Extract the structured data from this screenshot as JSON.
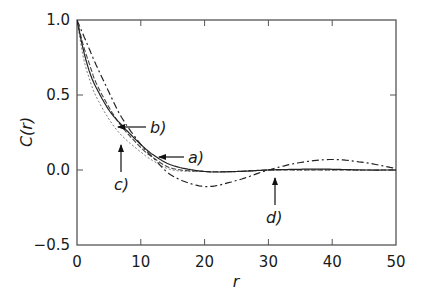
{
  "chart_data": {
    "type": "line",
    "title": "",
    "xlabel": "r",
    "ylabel": "C(r)",
    "xlim": [
      0,
      50
    ],
    "ylim": [
      -0.5,
      1.0
    ],
    "xticks": [
      0,
      10,
      20,
      30,
      40,
      50
    ],
    "yticks": [
      -0.5,
      0.0,
      0.5,
      1.0
    ],
    "xtick_labels": [
      "0",
      "10",
      "20",
      "30",
      "40",
      "50"
    ],
    "ytick_labels": [
      "−0.5",
      "0.0",
      "0.5",
      "1.0"
    ],
    "grid": false,
    "legend": "none (curves labeled with arrow annotations a)–d))",
    "x": [
      0,
      1,
      2,
      3,
      5,
      7,
      10,
      12,
      15,
      20,
      25,
      30,
      35,
      40,
      45,
      50
    ],
    "series": [
      {
        "name": "a)",
        "style": "solid",
        "values": [
          1.0,
          0.8,
          0.65,
          0.55,
          0.4,
          0.3,
          0.17,
          0.1,
          0.03,
          -0.01,
          -0.01,
          0.0,
          0.005,
          0.005,
          0.0,
          0.0
        ]
      },
      {
        "name": "b)",
        "style": "dashed",
        "values": [
          1.0,
          0.83,
          0.7,
          0.58,
          0.42,
          0.29,
          0.15,
          0.08,
          0.01,
          -0.01,
          -0.01,
          0.0,
          0.0,
          0.0,
          0.0,
          0.0
        ]
      },
      {
        "name": "c)",
        "style": "dotted",
        "values": [
          1.0,
          0.75,
          0.6,
          0.49,
          0.34,
          0.23,
          0.12,
          0.06,
          0.0,
          -0.01,
          -0.01,
          0.0,
          0.0,
          0.0,
          0.0,
          0.0
        ]
      },
      {
        "name": "d)",
        "style": "dash-dot",
        "values": [
          1.0,
          0.9,
          0.8,
          0.7,
          0.52,
          0.35,
          0.17,
          0.08,
          -0.04,
          -0.11,
          -0.07,
          0.0,
          0.05,
          0.07,
          0.05,
          0.01
        ]
      }
    ],
    "annotations": [
      {
        "label": "a)",
        "arrow": "horizontal, pointing left",
        "target_r": 12.8,
        "target_C": 0.09
      },
      {
        "label": "b)",
        "arrow": "horizontal, pointing left",
        "target_r": 6.4,
        "target_C": 0.29
      },
      {
        "label": "c)",
        "arrow": "vertical, pointing up",
        "target_r": 6.9,
        "target_C": 0.17
      },
      {
        "label": "d)",
        "arrow": "vertical, pointing up",
        "target_r": 31.0,
        "target_C": -0.05
      }
    ]
  },
  "axes": {
    "xlabel": "r",
    "ylabel": "C(r)",
    "xtick_labels": [
      "0",
      "10",
      "20",
      "30",
      "40",
      "50"
    ],
    "ytick_labels": [
      "1.0",
      "0.5",
      "0.0",
      "−0.5"
    ]
  },
  "annotations": {
    "a": "a)",
    "b": "b)",
    "c": "c)",
    "d": "d)"
  }
}
